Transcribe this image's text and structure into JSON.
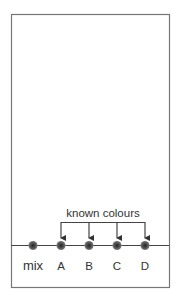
{
  "diagram": {
    "bracket_label": "known colours",
    "spots": [
      {
        "label": "mix",
        "x": 33
      },
      {
        "label": "A",
        "x": 61
      },
      {
        "label": "B",
        "x": 89
      },
      {
        "label": "C",
        "x": 117
      },
      {
        "label": "D",
        "x": 145
      }
    ],
    "colors": {
      "paper_border": "#777777",
      "baseline": "#444444",
      "spot": "#555555",
      "spot_center": "#222222"
    }
  }
}
